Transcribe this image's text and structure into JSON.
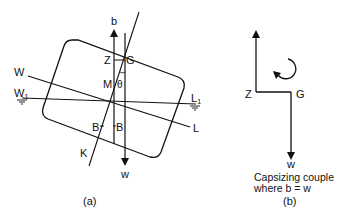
{
  "figure": {
    "panel_a": {
      "caption": "(a)",
      "labels": {
        "b": "b",
        "w": "w",
        "Z": "Z",
        "G": "G",
        "M": "M",
        "theta": "θ",
        "W": "W",
        "W1": "W",
        "W1_sub": "1",
        "L": "L",
        "L1": "L",
        "L1_sub": "1",
        "B1": "B",
        "B": "B",
        "K": "K"
      }
    },
    "panel_b": {
      "caption": "(b)",
      "labels": {
        "Z": "Z",
        "G": "G",
        "w": "w"
      },
      "note_line1": "Capsizing couple",
      "note_line2": "where b = w"
    },
    "colors": {
      "stroke": "#111111",
      "background": "#ffffff"
    }
  }
}
